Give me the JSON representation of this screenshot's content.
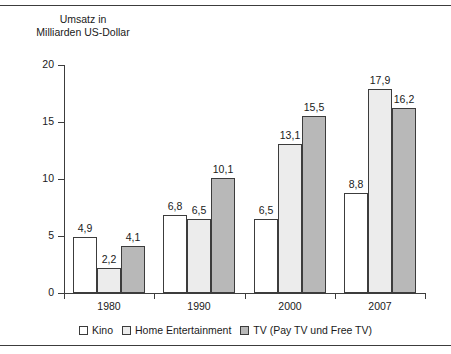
{
  "chart_data": {
    "type": "bar",
    "title_line1": "Umsatz in",
    "title_line2": "Milliarden US-Dollar",
    "xlabel": "",
    "ylabel": "Umsatz in Milliarden US-Dollar",
    "categories": [
      "1980",
      "1990",
      "2000",
      "2007"
    ],
    "ylim": [
      0,
      20
    ],
    "yticks": [
      0,
      5,
      10,
      15,
      20
    ],
    "ytick_labels": [
      "0",
      "5",
      "10",
      "15",
      "20"
    ],
    "grid": false,
    "legend_position": "bottom",
    "decimal_separator": ",",
    "series": [
      {
        "name": "Kino",
        "color": "#ffffff",
        "values": [
          4.9,
          6.8,
          6.5,
          8.8
        ],
        "labels": [
          "4,9",
          "6,8",
          "6,5",
          "8,8"
        ]
      },
      {
        "name": "Home Entertainment",
        "color": "#ececec",
        "values": [
          2.2,
          6.5,
          13.1,
          17.9
        ],
        "labels": [
          "2,2",
          "6,5",
          "13,1",
          "17,9"
        ]
      },
      {
        "name": "TV (Pay TV und Free TV)",
        "color": "#b8b8b8",
        "values": [
          4.1,
          10.1,
          15.5,
          16.2
        ],
        "labels": [
          "4,1",
          "10,1",
          "15,5",
          "16,2"
        ]
      }
    ]
  },
  "legend": {
    "items": [
      {
        "label": "Kino",
        "swatch": "s0"
      },
      {
        "label": "Home Entertainment",
        "swatch": "s1"
      },
      {
        "label": "TV (Pay TV und Free TV)",
        "swatch": "s2"
      }
    ]
  }
}
